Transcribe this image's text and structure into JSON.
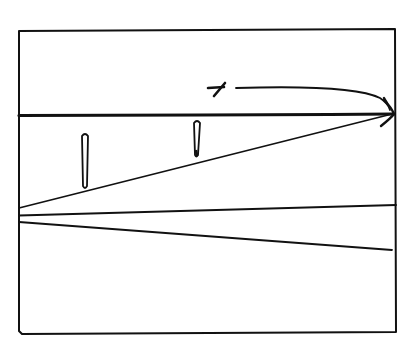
{
  "diagram": {
    "kind": "hand-drawn line sketch",
    "stroke_color": "#111111",
    "background_color": "#ffffff",
    "frame": {
      "x1": 18,
      "y1": 30,
      "x2": 396,
      "y2": 333
    },
    "elements": [
      {
        "id": "horizontal-line",
        "type": "line",
        "x1": 18,
        "y1": 115,
        "x2": 395,
        "y2": 114,
        "weight": "thick"
      },
      {
        "id": "rising-diagonal",
        "type": "line",
        "x1": 18,
        "y1": 208,
        "x2": 392,
        "y2": 114,
        "weight": "normal"
      },
      {
        "id": "convergence-arrowhead",
        "type": "arrowhead",
        "x": 393,
        "y": 114
      },
      {
        "id": "marker-left",
        "type": "vertical-marker",
        "x": 85,
        "y_top": 134,
        "y_bottom": 188
      },
      {
        "id": "marker-right",
        "type": "vertical-marker",
        "x": 197,
        "y_top": 121,
        "y_bottom": 157
      },
      {
        "id": "x-glyph",
        "type": "glyph",
        "x": 216,
        "y": 88
      },
      {
        "id": "curved-arrow",
        "type": "curve",
        "from": [
          236,
          88
        ],
        "to": [
          389,
          110
        ]
      },
      {
        "id": "lower-line-1",
        "type": "line",
        "x1": 18,
        "y1": 215,
        "x2": 396,
        "y2": 205
      },
      {
        "id": "lower-line-2",
        "type": "line",
        "x1": 18,
        "y1": 222,
        "x2": 392,
        "y2": 250
      }
    ]
  }
}
